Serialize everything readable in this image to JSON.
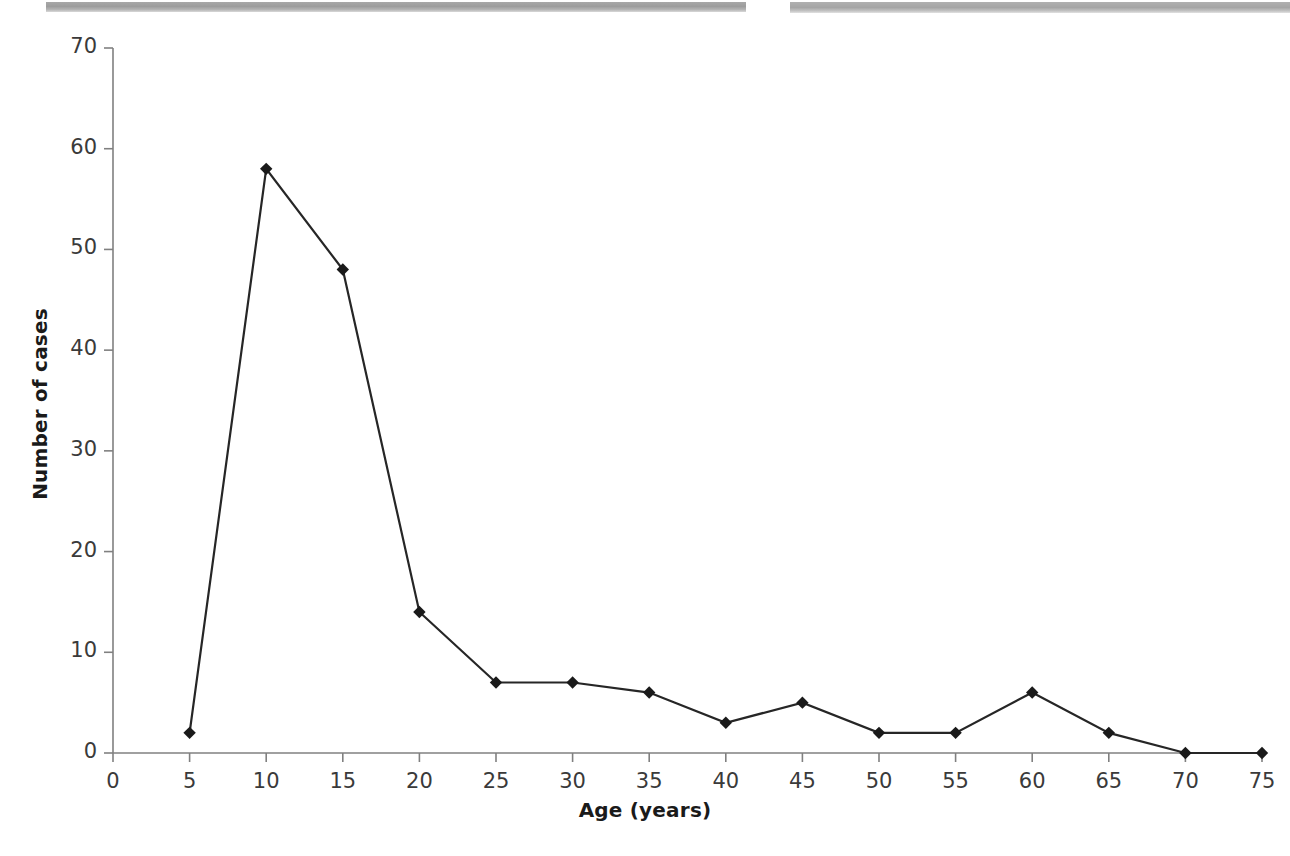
{
  "figure": {
    "background_color": "#ffffff",
    "line_color": "#262626",
    "marker_color": "#1a1a1a",
    "axis_color": "#808080",
    "tick_text_color": "#3a3a3a",
    "title_text_color": "#1a1a1a"
  },
  "artifacts": {
    "top_band_left_label": "scan-band-left",
    "top_band_right_label": "scan-band-right",
    "band_color": "#a5a5a5"
  },
  "chart_data": {
    "type": "line",
    "title": "",
    "xlabel": "Age (years)",
    "ylabel": "Number of cases",
    "x": [
      5,
      10,
      15,
      20,
      25,
      30,
      35,
      40,
      45,
      50,
      55,
      60,
      65,
      70,
      75
    ],
    "values": [
      2,
      58,
      48,
      14,
      7,
      7,
      6,
      3,
      5,
      2,
      2,
      6,
      2,
      0,
      0
    ],
    "series": [
      {
        "name": "Number of cases",
        "x": [
          5,
          10,
          15,
          20,
          25,
          30,
          35,
          40,
          45,
          50,
          55,
          60,
          65,
          70,
          75
        ],
        "values": [
          2,
          58,
          48,
          14,
          7,
          7,
          6,
          3,
          5,
          2,
          2,
          6,
          2,
          0,
          0
        ]
      }
    ],
    "xlim": [
      0,
      75
    ],
    "ylim": [
      0,
      70
    ],
    "xticks": [
      0,
      5,
      10,
      15,
      20,
      25,
      30,
      35,
      40,
      45,
      50,
      55,
      60,
      65,
      70,
      75
    ],
    "xtick_labels": [
      "0",
      "5",
      "10",
      "15",
      "20",
      "25",
      "30",
      "35",
      "40",
      "45",
      "50",
      "55",
      "60",
      "65",
      "70",
      "75"
    ],
    "yticks": [
      0,
      10,
      20,
      30,
      40,
      50,
      60,
      70
    ],
    "ytick_labels": [
      "0",
      "10",
      "20",
      "30",
      "40",
      "50",
      "60",
      "70"
    ],
    "grid": false,
    "legend": false,
    "legend_position": "none",
    "marker": "diamond",
    "annotations": []
  }
}
